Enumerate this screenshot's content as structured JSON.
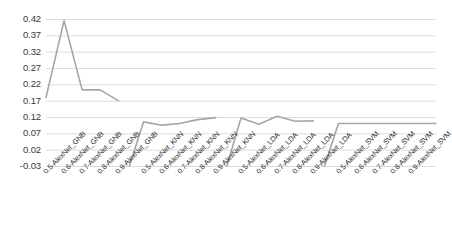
{
  "chart_data": {
    "type": "line",
    "title": "",
    "xlabel": "",
    "ylabel": "",
    "ylim": [
      -0.03,
      0.42
    ],
    "ytick_step": 0.05,
    "grid": true,
    "legend": "none",
    "line_color": "#a6a6a6",
    "categories": [
      "0.5-AlexNet_GNB",
      "0.6-AlexNet_GNB",
      "0.7-AlexNet_GNB",
      "0.8-AlexNet_GNB",
      "0.9-AlexNet_GNB",
      "0.5-AlexNet_KNN",
      "0.6-AlexNet_KNN",
      "0.7-AlexNet_KNN",
      "0.8-AlexNet_KNN",
      "0.9-AlexNet_KNN",
      "0.5-AlexNet_LDA",
      "0.6-AlexNet_LDA",
      "0.7-AlexNet_LDA",
      "0.8-AlexNet_LDA",
      "0.9-AlexNet_LDA",
      "0.5-AlexNet_SVM",
      "0.6-AlexNet_SVM",
      "0.7-AlexNet_SVM",
      "0.8-AlexNet_SVM",
      "0.9-AlexNet_SVM"
    ],
    "values": [
      0.18,
      0.415,
      0.203,
      0.203,
      0.17,
      0.105,
      0.095,
      0.1,
      0.112,
      0.118,
      0.117,
      0.098,
      0.122,
      0.107,
      0.108,
      0.1,
      0.1,
      0.1,
      0.1,
      0.1
    ],
    "ytick_labels": [
      "0.42",
      "0.37",
      "0.32",
      "0.27",
      "0.22",
      "0.17",
      "0.12",
      "0.07",
      "0.02",
      "-0.03"
    ],
    "ytick_values": [
      0.42,
      0.37,
      0.32,
      0.27,
      0.22,
      0.17,
      0.12,
      0.07,
      0.02,
      -0.03
    ],
    "groups": [
      {
        "name": "GNB",
        "values": [
          0.18,
          0.415,
          0.203,
          0.203,
          0.17
        ]
      },
      {
        "name": "KNN",
        "values": [
          0.105,
          0.095,
          0.1,
          0.112,
          0.118
        ]
      },
      {
        "name": "LDA",
        "values": [
          0.117,
          0.098,
          0.122,
          0.107,
          0.108
        ]
      },
      {
        "name": "SVM",
        "values": [
          0.1,
          0.1,
          0.1,
          0.1,
          0.1
        ]
      }
    ]
  }
}
